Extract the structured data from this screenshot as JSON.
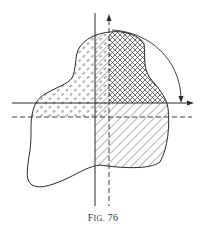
{
  "figure": {
    "caption_prefix": "F",
    "caption_smallcaps": "IG.",
    "caption_number": "76",
    "colors": {
      "ink": "#2a2a2a",
      "background": "#ffffff"
    },
    "elements": [
      "closed-region-outline",
      "solid-vertical-axis",
      "dashed-vertical-axis-with-arrow",
      "solid-horizontal-axis-with-arrow",
      "dashed-horizontal-line",
      "rotation-arc-arrow",
      "dashed-hatch-upper-left",
      "cross-hatch-upper-right",
      "diagonal-hatch-lower-right"
    ]
  }
}
